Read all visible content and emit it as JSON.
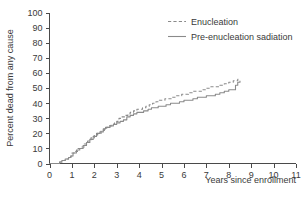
{
  "chart_data": {
    "type": "line",
    "title": "",
    "xlabel": "Years since enrollment",
    "ylabel": "Percent dead from any cause",
    "xlim": [
      0,
      11
    ],
    "ylim": [
      0,
      100
    ],
    "xticks": [
      "0",
      "1",
      "2",
      "3",
      "4",
      "5",
      "6",
      "7",
      "8",
      "9",
      "10",
      "11"
    ],
    "yticks": [
      "0",
      "10",
      "20",
      "30",
      "40",
      "50",
      "60",
      "70",
      "80",
      "90",
      "100"
    ],
    "grid": false,
    "legend_position": "top-right",
    "series": [
      {
        "name": "Enucleation",
        "style": "dashed",
        "color": "#8a8a8a",
        "x": [
          0,
          0.25,
          0.45,
          0.55,
          0.7,
          0.85,
          0.95,
          1.0,
          1.1,
          1.25,
          1.4,
          1.55,
          1.7,
          1.85,
          2.0,
          2.15,
          2.3,
          2.45,
          2.55,
          2.65,
          2.75,
          2.9,
          3.0,
          3.1,
          3.2,
          3.35,
          3.5,
          3.6,
          3.75,
          3.9,
          4.0,
          4.15,
          4.3,
          4.45,
          4.6,
          4.75,
          4.9,
          5.0,
          5.15,
          5.3,
          5.45,
          5.6,
          5.75,
          5.9,
          6.0,
          6.2,
          6.4,
          6.6,
          6.8,
          7.0,
          7.2,
          7.4,
          7.6,
          7.8,
          8.0,
          8.2,
          8.4,
          8.5
        ],
        "y": [
          0,
          0,
          1,
          2,
          3,
          4,
          5,
          7,
          8,
          10,
          11,
          13,
          15,
          17,
          19,
          20,
          22,
          23,
          24,
          25,
          26,
          27,
          28,
          30,
          31,
          32,
          33,
          34,
          35,
          36,
          36,
          37,
          38,
          39,
          40,
          41,
          42,
          42,
          43,
          43,
          44,
          45,
          45,
          46,
          46,
          47,
          48,
          48,
          49,
          50,
          51,
          51,
          52,
          53,
          54,
          55,
          56,
          56
        ]
      },
      {
        "name": "Pre-enucleation sadiation",
        "style": "solid",
        "color": "#8a8a8a",
        "x": [
          0,
          0.25,
          0.45,
          0.55,
          0.7,
          0.85,
          0.95,
          1.0,
          1.05,
          1.2,
          1.35,
          1.5,
          1.65,
          1.8,
          1.95,
          2.1,
          2.25,
          2.4,
          2.5,
          2.6,
          2.7,
          2.85,
          3.0,
          3.15,
          3.3,
          3.45,
          3.6,
          3.75,
          3.9,
          4.0,
          4.2,
          4.4,
          4.55,
          4.7,
          4.85,
          5.0,
          5.2,
          5.4,
          5.6,
          5.8,
          6.0,
          6.2,
          6.4,
          6.6,
          6.8,
          7.0,
          7.2,
          7.4,
          7.6,
          7.8,
          8.0,
          8.15,
          8.3,
          8.4,
          8.5
        ],
        "y": [
          0,
          0,
          1,
          2,
          3,
          4,
          5,
          5,
          7,
          9,
          10,
          12,
          14,
          16,
          18,
          20,
          21,
          23,
          24,
          24,
          25,
          26,
          27,
          28,
          29,
          31,
          32,
          33,
          34,
          34,
          35,
          36,
          37,
          37,
          38,
          38,
          39,
          40,
          40,
          41,
          42,
          42,
          43,
          44,
          44,
          45,
          45,
          46,
          47,
          48,
          49,
          49,
          52,
          54,
          55
        ]
      }
    ]
  },
  "legend": {
    "items": [
      {
        "label": "Enucleation"
      },
      {
        "label": "Pre-enucleation sadiation"
      }
    ]
  },
  "colors": {
    "line": "#8a8a8a",
    "axis": "#4a4a4a",
    "text": "#3a3a3a",
    "background": "#ffffff"
  }
}
